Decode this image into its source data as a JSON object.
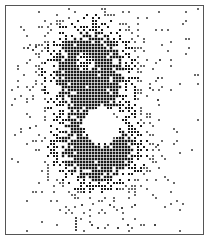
{
  "chart_data": {
    "type": "scatter",
    "subtype": "dot-density",
    "title": "",
    "xlabel": "",
    "ylabel": "",
    "grid": false,
    "legend": null,
    "frame": {
      "x": 5,
      "y": 5,
      "width": 199,
      "height": 230,
      "color": "#555555"
    },
    "dot_grid_pitch": 3,
    "dot_color": "#1a1a1a",
    "clusters": [
      {
        "name": "upper-lobe",
        "cx": 88,
        "cy": 68,
        "sx": 26,
        "sy": 30,
        "peak_density": 0.95
      },
      {
        "name": "lower-lobe",
        "cx": 98,
        "cy": 152,
        "sx": 28,
        "sy": 22,
        "peak_density": 0.95
      },
      {
        "name": "central-band",
        "cx": 95,
        "cy": 110,
        "sx": 35,
        "sy": 60,
        "peak_density": 0.35
      }
    ],
    "hole": {
      "cx": 102,
      "cy": 126,
      "r": 16
    },
    "inner_ring": {
      "cx": 85,
      "cy": 62,
      "r": 9,
      "density": 0.55
    },
    "background_noise_density": 0.015,
    "extra_points": [
      {
        "x": 76,
        "y": 218
      },
      {
        "x": 76,
        "y": 221
      },
      {
        "x": 76,
        "y": 224
      },
      {
        "x": 76,
        "y": 227
      },
      {
        "x": 76,
        "y": 230
      },
      {
        "x": 92,
        "y": 225
      },
      {
        "x": 98,
        "y": 228
      },
      {
        "x": 118,
        "y": 228
      },
      {
        "x": 128,
        "y": 225
      },
      {
        "x": 155,
        "y": 225
      },
      {
        "x": 82,
        "y": 205
      },
      {
        "x": 110,
        "y": 205
      },
      {
        "x": 122,
        "y": 208
      },
      {
        "x": 135,
        "y": 205
      },
      {
        "x": 28,
        "y": 48
      },
      {
        "x": 33,
        "y": 50
      },
      {
        "x": 36,
        "y": 47
      },
      {
        "x": 160,
        "y": 60
      },
      {
        "x": 158,
        "y": 78
      },
      {
        "x": 158,
        "y": 100
      },
      {
        "x": 150,
        "y": 88
      },
      {
        "x": 44,
        "y": 90
      },
      {
        "x": 30,
        "y": 128
      },
      {
        "x": 158,
        "y": 145
      }
    ]
  }
}
